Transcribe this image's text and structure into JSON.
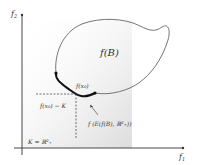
{
  "diagram": {
    "axes": {
      "x_label": "f",
      "x_sub": "1",
      "y_label": "f",
      "y_sub": "2"
    },
    "set_label": "f(B)",
    "point_label": "f(x₀)",
    "cone_translate_label": "f(x₀) − K",
    "efficient_label": "f (E(f(B), ℝ²₊))",
    "cone_label": "K = ℝ²₊",
    "colors": {
      "axis": "#333333",
      "boundary": "#666666",
      "efficient_front": "#111111",
      "cone_fill": "#e6e6e6"
    }
  }
}
